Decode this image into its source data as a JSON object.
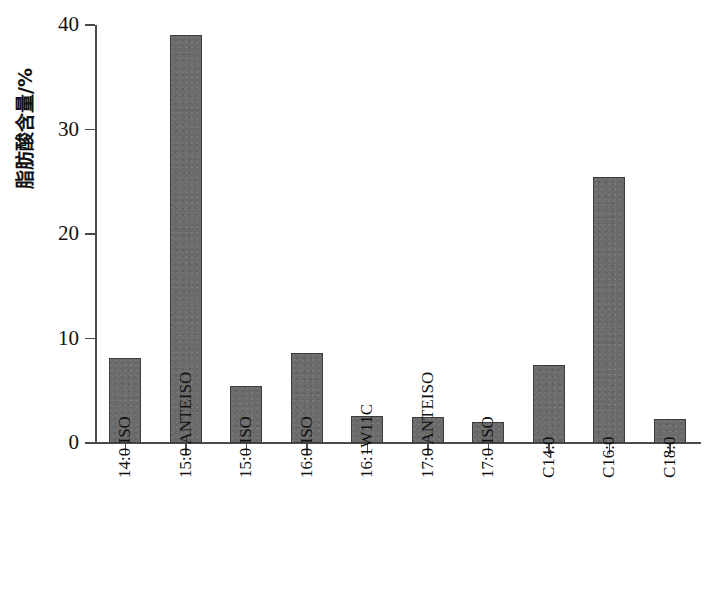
{
  "chart_data": {
    "type": "bar",
    "title": "",
    "xlabel": "",
    "ylabel": "脂肪酸含量/%",
    "ylim": [
      0,
      40
    ],
    "yticks": [
      0,
      10,
      20,
      30,
      40
    ],
    "ytick_labels": [
      "0",
      "10",
      "20",
      "30",
      "40"
    ],
    "grid": false,
    "legend": null,
    "bar_color": "#6b6b6b",
    "bar_edge_color": "#3d3d3d",
    "axis_color": "#4a4a4a",
    "categories": [
      "14:0 ISO",
      "15:0 ANTEISO",
      "15:0 ISO",
      "16:0 ISO",
      "16:1W11C",
      "17:0 ANTEISO",
      "17:0 ISO",
      "C14:0",
      "C16:0",
      "C18:0"
    ],
    "values": [
      8.1,
      39.0,
      5.5,
      8.6,
      2.6,
      2.5,
      2.0,
      7.5,
      25.5,
      2.3
    ]
  }
}
